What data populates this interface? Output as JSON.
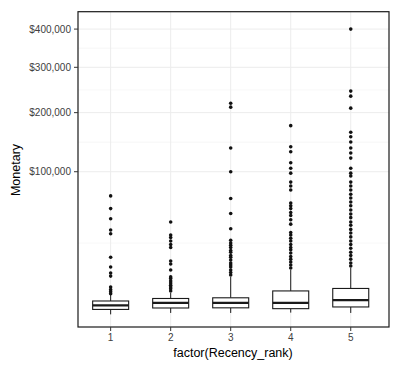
{
  "colors": {
    "background": "#ffffff",
    "panel_border": "#1a1a1a",
    "box_fill": "#ffffff",
    "box_stroke": "#1a1a1a",
    "outlier": "#111111",
    "grid_major": "#ececec",
    "grid_minor": "#f5f5f5",
    "tick_mark": "#333333",
    "tick_label": "#404040"
  },
  "chart_data": {
    "type": "boxplot",
    "title": "",
    "xlabel": "factor(Recency_rank)",
    "ylabel": "Monetary",
    "categories": [
      "1",
      "2",
      "3",
      "4",
      "5"
    ],
    "x_tick_labels": [
      "1",
      "2",
      "3",
      "4",
      "5"
    ],
    "y_axis": {
      "scale": "sqrt",
      "tick_values": [
        100000,
        200000,
        300000,
        400000
      ],
      "tick_labels": [
        "$100,000",
        "$200,000",
        "$300,000",
        "$400,000"
      ],
      "minor_break_base": [
        0,
        100000,
        200000,
        300000,
        400000
      ],
      "t_min": -28,
      "t_max": 671,
      "grid": true
    },
    "series": [
      {
        "category": "1",
        "whisker_low": 0,
        "q1": 120,
        "median": 390,
        "q3": 880,
        "whisker_high": 1850,
        "outliers": [
          69000,
          55000,
          45000,
          35000,
          32000,
          16000,
          11000,
          8400,
          7200,
          3700,
          3000,
          2500,
          2100
        ]
      },
      {
        "category": "2",
        "whisker_low": 10,
        "q1": 200,
        "median": 640,
        "q3": 1240,
        "whisker_high": 2250,
        "outliers": [
          42000,
          31000,
          29000,
          26500,
          24000,
          22000,
          14000,
          12500,
          9700,
          6900,
          6300,
          5500,
          4800,
          4200,
          3700,
          3200,
          2700
        ]
      },
      {
        "category": "3",
        "whisker_low": 10,
        "q1": 210,
        "median": 660,
        "q3": 1350,
        "whisker_high": 6900,
        "outliers": [
          219000,
          211000,
          136000,
          100000,
          66000,
          50000,
          36000,
          27000,
          25000,
          23500,
          22000,
          20000,
          19000,
          17000,
          16000,
          14500,
          13000,
          12000,
          11000,
          9700,
          8600,
          7600
        ]
      },
      {
        "category": "4",
        "whisker_low": 15,
        "q1": 160,
        "median": 650,
        "q3": 2700,
        "whisker_high": 9700,
        "outliers": [
          175000,
          138000,
          130000,
          113000,
          105000,
          98000,
          86000,
          81000,
          76000,
          61000,
          58000,
          55000,
          51000,
          48000,
          44000,
          40000,
          33000,
          31000,
          28500,
          26500,
          24000,
          22000,
          20500,
          18500,
          16500,
          15000,
          13500,
          12000,
          10600
        ]
      },
      {
        "category": "5",
        "whisker_low": 10,
        "q1": 270,
        "median": 1000,
        "q3": 3300,
        "whisker_high": 10600,
        "outliers": [
          400000,
          245000,
          234000,
          209000,
          163000,
          155000,
          146000,
          136000,
          128000,
          120000,
          105000,
          98000,
          94000,
          86000,
          81000,
          76000,
          71000,
          66500,
          62000,
          58000,
          53500,
          49500,
          46000,
          42000,
          39000,
          35500,
          32500,
          29500,
          26500,
          24000,
          21500,
          19000,
          17000,
          15000,
          13000,
          11500
        ]
      }
    ]
  }
}
